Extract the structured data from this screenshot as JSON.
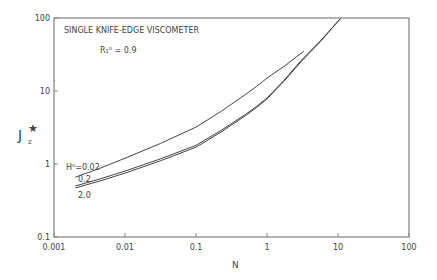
{
  "chart_data": {
    "type": "line",
    "title": "SINGLE KNIFE-EDGE VISCOMETER",
    "annotation": "R₁⁰ = 0.9",
    "xlabel": "N",
    "ylabel": "J_z*",
    "xscale": "log",
    "yscale": "log",
    "xlim": [
      0.001,
      100
    ],
    "ylim": [
      0.1,
      100
    ],
    "x_ticks": [
      "0.001",
      "0.01",
      "0.1",
      "1",
      "10",
      "100"
    ],
    "y_ticks": [
      "0.1",
      "1",
      "10",
      "100"
    ],
    "grid": false,
    "series": [
      {
        "name": "H⁰=0.02",
        "x": [
          0.002,
          0.01,
          0.1,
          0.5,
          1,
          3.3
        ],
        "y": [
          0.66,
          1.2,
          3.2,
          9,
          15,
          35
        ]
      },
      {
        "name": "0.2",
        "x": [
          0.002,
          0.01,
          0.1,
          0.5,
          1,
          3,
          11
        ],
        "y": [
          0.5,
          0.8,
          1.8,
          4.8,
          8,
          26,
          100
        ]
      },
      {
        "name": "2.0",
        "x": [
          0.002,
          0.01,
          0.1,
          0.5,
          1,
          3,
          11
        ],
        "y": [
          0.47,
          0.75,
          1.7,
          4.6,
          7.8,
          25,
          100
        ]
      }
    ]
  }
}
